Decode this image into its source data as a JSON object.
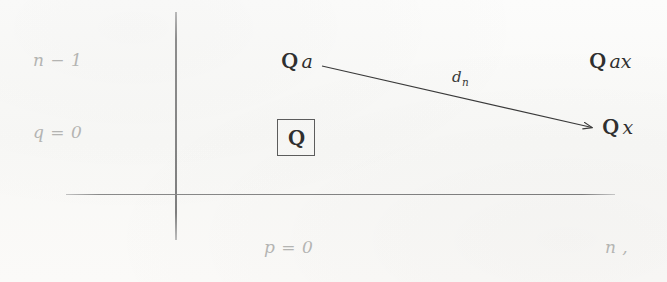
{
  "figure": {
    "type": "spectral-sequence-page-diagram",
    "background_color": "#fbfbfa",
    "axis_color": "#808080",
    "axis_label_color": "#b4b4b2",
    "node_text_color": "#2f2f2f",
    "arrow_color": "#3a3a3a"
  },
  "axes": {
    "vertical": {
      "x": 176,
      "y_top": 12,
      "y_bottom": 240
    },
    "horizontal": {
      "y": 194,
      "x_left": 66,
      "x_right": 615
    },
    "labels": {
      "y_upper": "n − 1",
      "y_lower": "q = 0",
      "x_center": "p = 0",
      "x_right": "n ,"
    }
  },
  "nodes": [
    {
      "id": "node-a",
      "blackboard": "Q",
      "subscript_text": "a",
      "x": 281,
      "y": 56,
      "boxed": false
    },
    {
      "id": "node-ax",
      "blackboard": "Q",
      "subscript_text": "ax",
      "x": 589,
      "y": 56,
      "boxed": false
    },
    {
      "id": "node-x",
      "blackboard": "Q",
      "subscript_text": "x",
      "x": 602,
      "y": 119,
      "boxed": false
    },
    {
      "id": "node-q",
      "blackboard": "Q",
      "subscript_text": "",
      "x": 277,
      "y": 119,
      "boxed": true
    }
  ],
  "arrow": {
    "label": "d",
    "label_subscript": "n",
    "from_x": 322,
    "from_y": 66,
    "to_x": 594,
    "to_y": 128
  }
}
